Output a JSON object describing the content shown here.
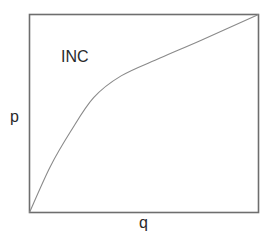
{
  "chart_data": {
    "type": "line",
    "title": "",
    "xlabel": "q",
    "ylabel": "p",
    "xlim": [
      0,
      1
    ],
    "ylim": [
      0,
      1
    ],
    "grid": false,
    "ticks": false,
    "legend": null,
    "annotations": [
      {
        "text": "INC",
        "x": 0.14,
        "y": 0.78
      }
    ],
    "series": [
      {
        "name": "INC",
        "color": "#8a8a8a",
        "x": [
          0.0,
          0.09,
          0.18,
          0.28,
          0.4,
          0.57,
          0.75,
          1.0
        ],
        "y": [
          0.0,
          0.23,
          0.41,
          0.58,
          0.69,
          0.78,
          0.87,
          1.0
        ]
      }
    ]
  },
  "labels": {
    "curve": "INC",
    "x_axis": "q",
    "y_axis": "p"
  },
  "style": {
    "frame_color": "#6e6e6e",
    "curve_color": "#8a8a8a",
    "text_color": "#2a2a2a"
  }
}
